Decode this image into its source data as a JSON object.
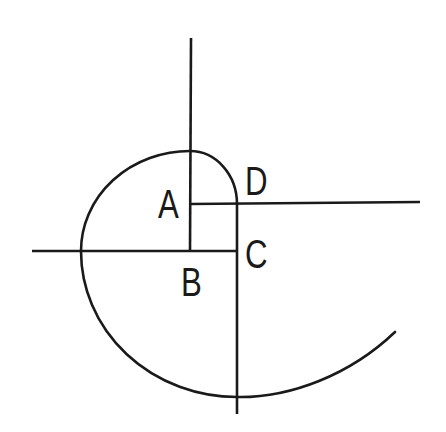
{
  "diagram": {
    "type": "spiral-construction",
    "labels": {
      "a": "A",
      "b": "B",
      "c": "C",
      "d": "D"
    },
    "colors": {
      "stroke": "#1a1a1a",
      "background": "#ffffff"
    }
  }
}
